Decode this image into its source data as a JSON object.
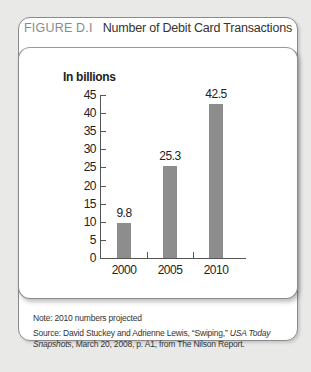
{
  "figure": {
    "label": "FIGURE D.I",
    "title": "Number of Debit Card Transactions"
  },
  "chart_data": {
    "type": "bar",
    "title": "Number of Debit Card Transactions",
    "ylabel": "In billions",
    "xlabel": "",
    "categories": [
      "2000",
      "2005",
      "2010"
    ],
    "values": [
      9.8,
      25.3,
      42.5
    ],
    "value_labels": [
      "9.8",
      "25.3",
      "42.5"
    ],
    "ylim": [
      0,
      45
    ],
    "yticks": [
      "0",
      "5",
      "10",
      "15",
      "20",
      "25",
      "30",
      "35",
      "40",
      "45"
    ],
    "grid": false,
    "legend": null,
    "bar_color": "#8d8d8d"
  },
  "footer": {
    "note": "Note: 2010 numbers projected",
    "source_prefix": "Source: David Stuckey and Adrienne Lewis, “Swiping,” ",
    "source_pub": "USA Today Snapshots",
    "source_suffix": ", March 20, 2008, p. A1, from The Nilson Report."
  }
}
